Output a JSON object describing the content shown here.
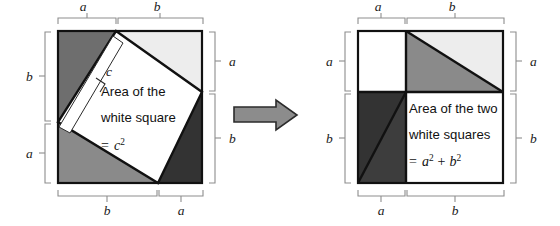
{
  "figure": {
    "title_visible": false,
    "background_color": "#ffffff",
    "topic": "pythagorean-theorem-proof-by-rearrangement"
  },
  "colors": {
    "outline": "#111111",
    "bracket": "#8d8d8d",
    "white": "#ffffff",
    "light_gray": "#ededed",
    "medium_gray": "#8a8a8a",
    "medium_dark_gray": "#6e6e6e",
    "dark_gray": "#333333",
    "arrow_fill": "#8c8c8c",
    "arrow_stroke": "#2b2b2b",
    "text": "#111111"
  },
  "left_panel": {
    "name": "tilted-inner-square-figure",
    "caption_lines": [
      "Area of the",
      "white square"
    ],
    "caption_equation": {
      "equals": "=",
      "base": "c",
      "exponent": "2"
    },
    "hypotenuse_label": "c",
    "brackets": {
      "top": [
        {
          "label": "a",
          "segment": "left"
        },
        {
          "label": "b",
          "segment": "right"
        }
      ],
      "right": [
        {
          "label": "a",
          "segment": "top"
        },
        {
          "label": "b",
          "segment": "bottom"
        }
      ],
      "bottom": [
        {
          "label": "b",
          "segment": "left"
        },
        {
          "label": "a",
          "segment": "right"
        }
      ],
      "left": [
        {
          "label": "b",
          "segment": "top"
        },
        {
          "label": "a",
          "segment": "bottom"
        }
      ]
    },
    "regions": [
      {
        "name": "triangle-upper-left",
        "fill": "#6e6e6e"
      },
      {
        "name": "triangle-upper-right",
        "fill": "#ededed"
      },
      {
        "name": "triangle-lower-left",
        "fill": "#8a8a8a"
      },
      {
        "name": "triangle-lower-right",
        "fill": "#333333"
      },
      {
        "name": "inner-tilted-square",
        "fill": "#ffffff"
      },
      {
        "name": "side-length-strip",
        "fill": "#ffffff"
      }
    ]
  },
  "arrow": {
    "name": "transformation-arrow",
    "direction": "right"
  },
  "right_panel": {
    "name": "two-white-squares-figure",
    "caption_lines": [
      "Area of the two",
      "white squares"
    ],
    "caption_equation": {
      "equals": "=",
      "term_a": "a",
      "exp_a": "2",
      "plus": "+",
      "term_b": "b",
      "exp_b": "2"
    },
    "brackets": {
      "top": [
        {
          "label": "a",
          "segment": "left"
        },
        {
          "label": "b",
          "segment": "right"
        }
      ],
      "right": [
        {
          "label": "a",
          "segment": "top"
        },
        {
          "label": "b",
          "segment": "bottom"
        }
      ],
      "bottom": [
        {
          "label": "a",
          "segment": "left"
        },
        {
          "label": "b",
          "segment": "right"
        }
      ],
      "left": [
        {
          "label": "a",
          "segment": "top"
        },
        {
          "label": "b",
          "segment": "bottom"
        }
      ]
    },
    "regions": [
      {
        "name": "white-square-a",
        "fill": "#ffffff"
      },
      {
        "name": "white-square-b",
        "fill": "#ffffff"
      },
      {
        "name": "triangle-top-right-light",
        "fill": "#ededed"
      },
      {
        "name": "triangle-top-right-medium",
        "fill": "#8a8a8a"
      },
      {
        "name": "triangle-bottom-left-dark-a",
        "fill": "#333333"
      },
      {
        "name": "triangle-bottom-left-dark-b",
        "fill": "#3d3d3d"
      }
    ]
  }
}
